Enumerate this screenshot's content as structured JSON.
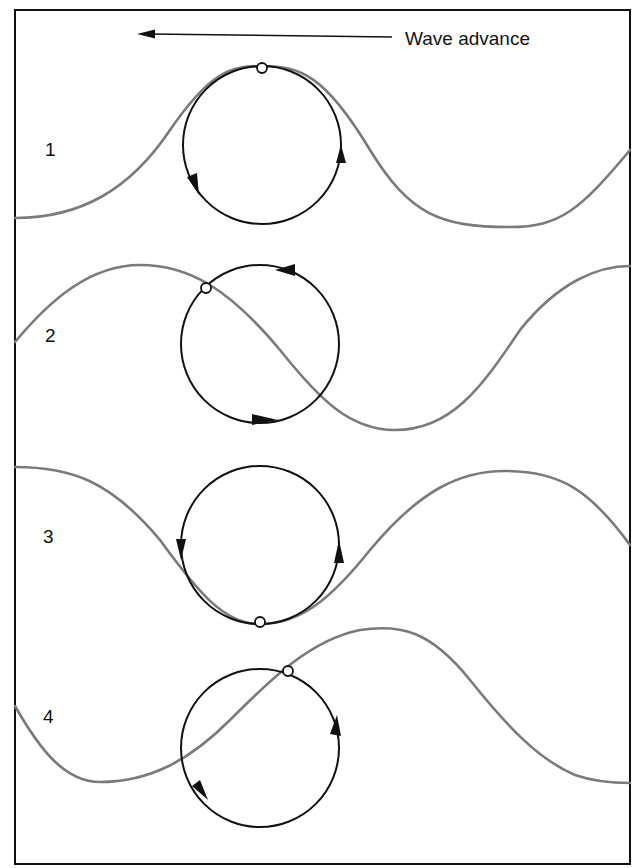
{
  "figure": {
    "advance_label": "Wave advance",
    "advance_direction": "left",
    "colors": {
      "frame": "#111111",
      "wave": "#7a7a7a",
      "orbit": "#111111",
      "background": "#ffffff"
    },
    "panels": [
      {
        "label": "1",
        "phase": "crest",
        "particle_position": "top of orbit",
        "orbit_direction": "counter-clockwise"
      },
      {
        "label": "2",
        "phase": "after crest",
        "particle_position": "upper-left of orbit",
        "orbit_direction": "counter-clockwise"
      },
      {
        "label": "3",
        "phase": "trough",
        "particle_position": "bottom of orbit",
        "orbit_direction": "counter-clockwise"
      },
      {
        "label": "4",
        "phase": "before crest",
        "particle_position": "upper-right of orbit",
        "orbit_direction": "counter-clockwise"
      }
    ]
  }
}
